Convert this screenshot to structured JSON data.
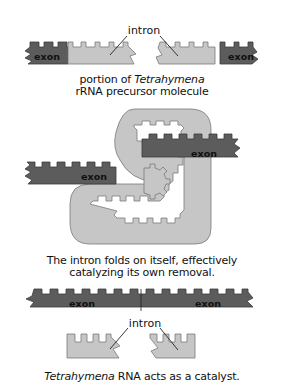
{
  "diagram": {
    "colors": {
      "exon": "#5c5c5c",
      "intron": "#c6c6c6",
      "outline": "#3a3a3a",
      "background": "#ffffff"
    },
    "panel1": {
      "intron_label": "intron",
      "exon_left_label": "exon",
      "exon_right_label": "exon",
      "caption_line1_prefix": "portion of ",
      "caption_line1_italic": "Tetrahymena",
      "caption_line2": "rRNA precursor molecule"
    },
    "panel2": {
      "exon_left_label": "exon",
      "exon_right_label": "exon",
      "caption_line1": "The intron folds on itself, effectively",
      "caption_line2": "catalyzing its own removal."
    },
    "panel3": {
      "exon_left_label": "exon",
      "exon_right_label": "exon",
      "intron_label": "intron",
      "caption_italic": "Tetrahymena",
      "caption_rest": " RNA acts as a catalyst."
    }
  }
}
